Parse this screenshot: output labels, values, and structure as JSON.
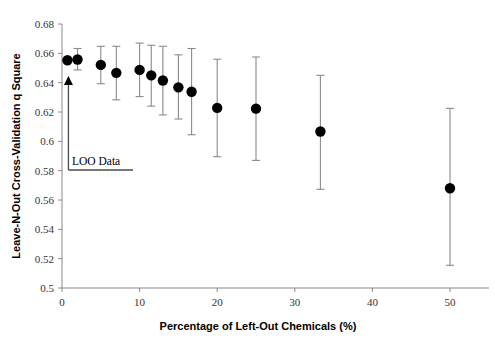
{
  "chart_data": {
    "type": "scatter",
    "title": "",
    "xlabel": "Percentage of Left-Out Chemicals (%)",
    "ylabel": "Leave-N-Out Cross-Validation q Square",
    "xlim": [
      0,
      55
    ],
    "ylim": [
      0.5,
      0.68
    ],
    "xticks": [
      0,
      10,
      20,
      30,
      40,
      50
    ],
    "xtick_labels": [
      "0",
      "10",
      "20",
      "30",
      "40",
      "50"
    ],
    "yticks": [
      0.5,
      0.52,
      0.54,
      0.56,
      0.58,
      0.6,
      0.62,
      0.64,
      0.66,
      0.68
    ],
    "ytick_labels": [
      "0.5",
      "0.52",
      "0.54",
      "0.56",
      "0.58",
      "0.6",
      "0.62",
      "0.64",
      "0.66",
      "0.68"
    ],
    "grid": false,
    "legend": false,
    "error_bars": "vertical",
    "marker": "filled-circle",
    "series": [
      {
        "name": "Leave-N-Out q Square",
        "points": [
          {
            "x": 0.7,
            "y": 0.6553,
            "ylow": 0.6553,
            "yhigh": 0.6553
          },
          {
            "x": 2.0,
            "y": 0.6558,
            "ylow": 0.6487,
            "yhigh": 0.6633
          },
          {
            "x": 5.0,
            "y": 0.6521,
            "ylow": 0.6393,
            "yhigh": 0.6648
          },
          {
            "x": 7.0,
            "y": 0.6467,
            "ylow": 0.6283,
            "yhigh": 0.6648
          },
          {
            "x": 10.0,
            "y": 0.6487,
            "ylow": 0.6305,
            "yhigh": 0.667
          },
          {
            "x": 11.5,
            "y": 0.645,
            "ylow": 0.624,
            "yhigh": 0.6655
          },
          {
            "x": 13.0,
            "y": 0.6415,
            "ylow": 0.618,
            "yhigh": 0.6648
          },
          {
            "x": 15.0,
            "y": 0.6368,
            "ylow": 0.6152,
            "yhigh": 0.659
          },
          {
            "x": 16.7,
            "y": 0.6338,
            "ylow": 0.6045,
            "yhigh": 0.6633
          },
          {
            "x": 20.0,
            "y": 0.6228,
            "ylow": 0.5895,
            "yhigh": 0.656
          },
          {
            "x": 25.0,
            "y": 0.6223,
            "ylow": 0.587,
            "yhigh": 0.6575
          },
          {
            "x": 33.3,
            "y": 0.6067,
            "ylow": 0.5673,
            "yhigh": 0.645
          },
          {
            "x": 50.0,
            "y": 0.568,
            "ylow": 0.5155,
            "yhigh": 0.6225
          }
        ]
      }
    ],
    "annotations": [
      {
        "text": "LOO Data",
        "type": "arrow-callout",
        "points_to_x": 0.7,
        "points_to_y": 0.6445
      }
    ]
  }
}
